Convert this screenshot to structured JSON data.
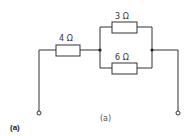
{
  "diagram": {
    "type": "circuit",
    "resistors": [
      {
        "id": "R1",
        "label": "4 Ω",
        "position": "series-left"
      },
      {
        "id": "R2",
        "label": "3 Ω",
        "position": "parallel-top"
      },
      {
        "id": "R3",
        "label": "6 Ω",
        "position": "parallel-bottom"
      }
    ],
    "caption": "(a)",
    "figure_label": "(a)",
    "colors": {
      "line": "#333333",
      "background": "#ffffff"
    }
  }
}
